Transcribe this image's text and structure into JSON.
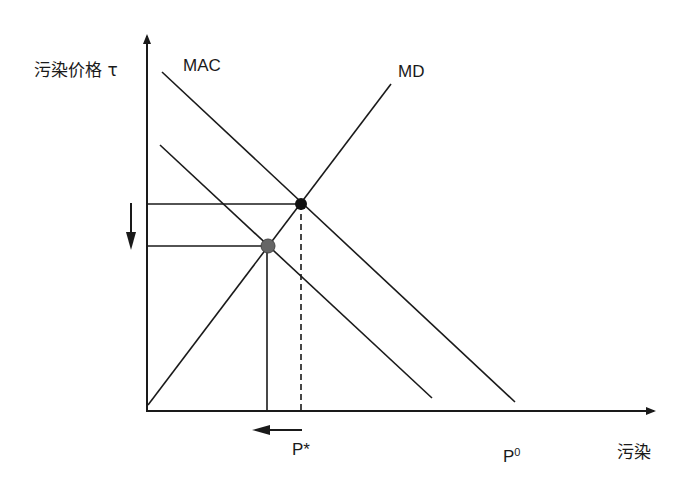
{
  "diagram": {
    "y_axis_label": "污染价格 τ",
    "x_axis_label": "污染",
    "curves": {
      "mac": "MAC",
      "md": "MD"
    },
    "x_marks": {
      "p_star": "P*",
      "p_zero_base": "P",
      "p_zero_sup": "0"
    },
    "colors": {
      "line": "#1a1a1a",
      "equilibrium_dot": "#111111",
      "new_equilibrium_dot": "#666666",
      "background": "#ffffff"
    }
  }
}
